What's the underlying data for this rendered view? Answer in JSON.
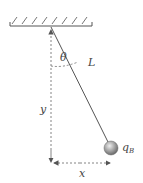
{
  "diagram": {
    "type": "pendulum",
    "labels": {
      "angle": "θ",
      "length": "L",
      "vertical": "y",
      "horizontal": "x",
      "charge": "q",
      "charge_sub": "B"
    },
    "colors": {
      "line": "#555555",
      "dashed": "#777777",
      "ball_light": "#e6e6e6",
      "ball_dark": "#707070"
    }
  }
}
